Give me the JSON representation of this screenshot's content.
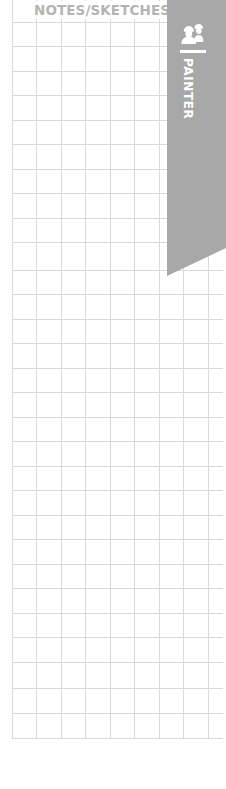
{
  "header": {
    "title": "NOTES/SKETCHES"
  },
  "ribbon": {
    "label": "PAINTER",
    "icon": "workers-hardhat-icon",
    "color": "#a8a8a8"
  },
  "grid": {
    "line_color": "#d6d6d6",
    "cell_size_px": 24.5,
    "columns": 8,
    "rows": 29
  }
}
